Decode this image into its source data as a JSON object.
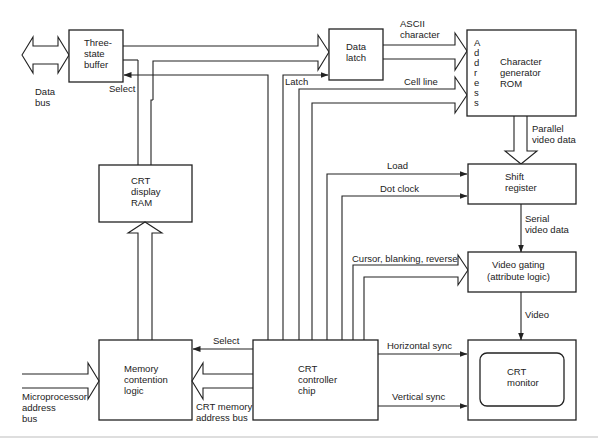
{
  "diagram": {
    "type": "block-diagram",
    "blocks": {
      "three_state_buffer": [
        "Three-",
        "state",
        "buffer"
      ],
      "data_latch": [
        "Data",
        "latch"
      ],
      "char_rom": [
        "Character",
        "generator",
        "ROM"
      ],
      "char_rom_address": [
        "A",
        "d",
        "d",
        "r",
        "e",
        "s",
        "s"
      ],
      "crt_display_ram": [
        "CRT",
        "display",
        "RAM"
      ],
      "shift_register": [
        "Shift",
        "register"
      ],
      "video_gating": [
        "Video gating",
        "(attribute logic)"
      ],
      "memory_contention": [
        "Memory",
        "contention",
        "logic"
      ],
      "crt_controller": [
        "CRT",
        "controller",
        "chip"
      ],
      "crt_monitor": [
        "CRT",
        "monitor"
      ]
    },
    "labels": {
      "data_bus": [
        "Data",
        "bus"
      ],
      "select_top": "Select",
      "latch": "Latch",
      "ascii_character": [
        "ASCII",
        "character"
      ],
      "cell_line": "Cell line",
      "parallel_video_data": [
        "Parallel",
        "video data"
      ],
      "load": "Load",
      "dot_clock": "Dot clock",
      "serial_video_data": [
        "Serial",
        "video data"
      ],
      "cursor_blanking_reverse": "Cursor, blanking, reverse",
      "video": "Video",
      "select_bottom": "Select",
      "horizontal_sync": "Horizontal sync",
      "vertical_sync": "Vertical sync",
      "microprocessor_address_bus": [
        "Microprocessor",
        "address",
        "bus"
      ],
      "crt_memory_address_bus": [
        "CRT memory",
        "address bus"
      ]
    },
    "connections": [
      {
        "from": "Data bus",
        "to": "Three-state buffer",
        "kind": "bidirectional bus"
      },
      {
        "from": "Three-state buffer",
        "to": "Data latch",
        "kind": "bus"
      },
      {
        "from": "Data latch",
        "to": "Character generator ROM",
        "label": "ASCII character",
        "kind": "bus"
      },
      {
        "from": "CRT controller chip",
        "to": "Character generator ROM",
        "label": "Cell line",
        "kind": "bus"
      },
      {
        "from": "CRT controller chip",
        "to": "Data latch",
        "label": "Latch",
        "kind": "signal"
      },
      {
        "from": "CRT controller chip",
        "to": "Three-state buffer",
        "label": "Select",
        "kind": "signal"
      },
      {
        "from": "Character generator ROM",
        "to": "Shift register",
        "label": "Parallel video data",
        "kind": "bus"
      },
      {
        "from": "CRT controller chip",
        "to": "Shift register",
        "label": "Load",
        "kind": "signal"
      },
      {
        "from": "CRT controller chip",
        "to": "Shift register",
        "label": "Dot clock",
        "kind": "signal"
      },
      {
        "from": "Shift register",
        "to": "Video gating",
        "label": "Serial video data",
        "kind": "signal"
      },
      {
        "from": "CRT controller chip",
        "to": "Video gating",
        "label": "Cursor, blanking, reverse",
        "kind": "bus"
      },
      {
        "from": "Video gating",
        "to": "CRT monitor",
        "label": "Video",
        "kind": "signal"
      },
      {
        "from": "CRT controller chip",
        "to": "CRT monitor",
        "label": "Horizontal sync",
        "kind": "signal"
      },
      {
        "from": "CRT controller chip",
        "to": "CRT monitor",
        "label": "Vertical sync",
        "kind": "signal"
      },
      {
        "from": "CRT controller chip",
        "to": "Memory contention logic",
        "label": "Select",
        "kind": "signal"
      },
      {
        "from": "CRT controller chip",
        "to": "Memory contention logic",
        "label": "CRT memory address bus",
        "kind": "bus"
      },
      {
        "from": "Microprocessor address bus",
        "to": "Memory contention logic",
        "kind": "bus"
      },
      {
        "from": "Memory contention logic",
        "to": "CRT display RAM",
        "kind": "bus"
      },
      {
        "from": "CRT display RAM",
        "to": "Three-state buffer",
        "kind": "bus"
      }
    ]
  }
}
